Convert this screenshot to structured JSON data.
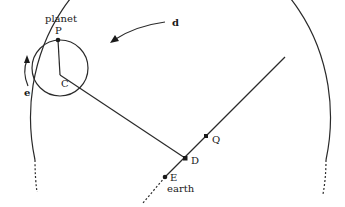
{
  "diagram": {
    "type": "epicycle-geometry",
    "labels": {
      "planet": "planet",
      "P": "P",
      "C": "C",
      "e": "e",
      "d": "d",
      "Q": "Q",
      "D": "D",
      "E": "E",
      "earth": "earth"
    },
    "elements": {
      "deferent": "large circle (deferent) passing through C",
      "epicycle": "small circle centered at C",
      "radius_CP": "line from C to planet P",
      "line_CD": "line from C to D",
      "line_of_centers": "line through Q, D, E extending to the deferent",
      "arrow_d": "direction of motion along deferent (counter-clockwise)",
      "arrow_e": "direction of motion along epicycle (counter-clockwise)"
    },
    "colors": {
      "ink": "#2a2a2a",
      "background": "#ffffff"
    }
  }
}
